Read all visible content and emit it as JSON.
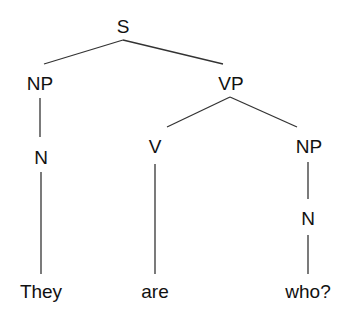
{
  "tree": {
    "nodes": [
      {
        "id": "s",
        "label": "S",
        "x": 123,
        "y": 26
      },
      {
        "id": "np1",
        "label": "NP",
        "x": 40,
        "y": 83
      },
      {
        "id": "vp",
        "label": "VP",
        "x": 231,
        "y": 83
      },
      {
        "id": "n1",
        "label": "N",
        "x": 41,
        "y": 157
      },
      {
        "id": "v",
        "label": "V",
        "x": 155,
        "y": 146
      },
      {
        "id": "np2",
        "label": "NP",
        "x": 309,
        "y": 146
      },
      {
        "id": "n2",
        "label": "N",
        "x": 308,
        "y": 218
      },
      {
        "id": "w1",
        "label": "They",
        "x": 41,
        "y": 291
      },
      {
        "id": "w2",
        "label": "are",
        "x": 155,
        "y": 291
      },
      {
        "id": "w3",
        "label": "who?",
        "x": 308,
        "y": 291
      }
    ],
    "edges": [
      [
        "s",
        "np1"
      ],
      [
        "s",
        "vp"
      ],
      [
        "np1",
        "n1"
      ],
      [
        "vp",
        "v"
      ],
      [
        "vp",
        "np2"
      ],
      [
        "n1",
        "w1"
      ],
      [
        "v",
        "w2"
      ],
      [
        "np2",
        "n2"
      ],
      [
        "n2",
        "w3"
      ]
    ],
    "line_color": "#333333"
  }
}
